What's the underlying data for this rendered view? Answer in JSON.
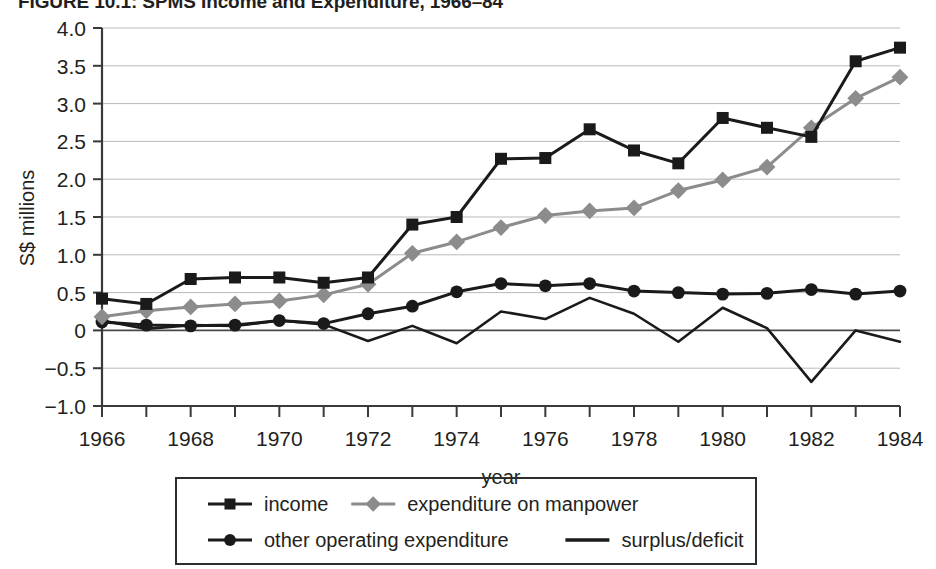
{
  "figure": {
    "title": "FIGURE 10.1: SPMS Income and Expenditure, 1966–84"
  },
  "chart_data": {
    "type": "line",
    "title": "FIGURE 10.1: SPMS Income and Expenditure, 1966–84",
    "xlabel": "year",
    "ylabel": "S$ millions",
    "grid": true,
    "legend_position": "bottom",
    "xlim": [
      1966,
      1984
    ],
    "ylim": [
      -1.0,
      4.0
    ],
    "yticks": [
      "4.0",
      "3.5",
      "3.0",
      "2.5",
      "2.0",
      "1.5",
      "1.0",
      "0.5",
      "0",
      "−0.5",
      "−1.0"
    ],
    "ytick_values": [
      4.0,
      3.5,
      3.0,
      2.5,
      2.0,
      1.5,
      1.0,
      0.5,
      0,
      -0.5,
      -1.0
    ],
    "xticks": [
      "1966",
      "1968",
      "1970",
      "1972",
      "1974",
      "1976",
      "1978",
      "1980",
      "1982",
      "1984"
    ],
    "xtick_values": [
      1966,
      1968,
      1970,
      1972,
      1974,
      1976,
      1978,
      1980,
      1982,
      1984
    ],
    "x": [
      1966,
      1967,
      1968,
      1969,
      1970,
      1971,
      1972,
      1973,
      1974,
      1975,
      1976,
      1977,
      1978,
      1979,
      1980,
      1981,
      1982,
      1983,
      1984
    ],
    "series": [
      {
        "name": "income",
        "marker": "square",
        "color": "#1a1a1a",
        "values": [
          0.42,
          0.35,
          0.68,
          0.7,
          0.7,
          0.63,
          0.7,
          1.4,
          1.5,
          2.27,
          2.28,
          2.66,
          2.38,
          2.21,
          2.81,
          2.68,
          2.56,
          3.56,
          3.74
        ]
      },
      {
        "name": "expenditure on manpower",
        "marker": "diamond",
        "color": "#8c8c8c",
        "values": [
          0.18,
          0.26,
          0.31,
          0.35,
          0.39,
          0.47,
          0.61,
          1.02,
          1.17,
          1.36,
          1.52,
          1.58,
          1.62,
          1.85,
          1.99,
          2.16,
          2.68,
          3.07,
          3.35
        ]
      },
      {
        "name": "other operating expenditure",
        "marker": "circle",
        "color": "#1a1a1a",
        "values": [
          0.11,
          0.07,
          0.06,
          0.07,
          0.13,
          0.09,
          0.22,
          0.32,
          0.51,
          0.62,
          0.59,
          0.62,
          0.52,
          0.5,
          0.48,
          0.49,
          0.54,
          0.48,
          0.52
        ]
      },
      {
        "name": "surplus/deficit",
        "marker": "none",
        "color": "#1a1a1a",
        "values": [
          0.13,
          0.02,
          0.07,
          0.06,
          0.13,
          0.08,
          -0.14,
          0.06,
          -0.17,
          0.25,
          0.15,
          0.43,
          0.22,
          -0.15,
          0.3,
          0.03,
          -0.68,
          0.0,
          -0.15
        ]
      }
    ]
  },
  "legend": {
    "items": [
      {
        "label": "income",
        "marker": "square",
        "color": "#1a1a1a"
      },
      {
        "label": "expenditure on manpower",
        "marker": "diamond",
        "color": "#8c8c8c"
      },
      {
        "label": "other operating expenditure",
        "marker": "circle",
        "color": "#1a1a1a"
      },
      {
        "label": "surplus/deficit",
        "marker": "none",
        "color": "#1a1a1a"
      }
    ]
  }
}
